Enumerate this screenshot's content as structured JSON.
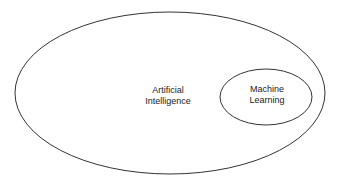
{
  "diagram": {
    "type": "venn-nested",
    "outer": {
      "label_line1": "Artificial",
      "label_line2": "Intelligence"
    },
    "inner": {
      "label_line1": "Machine",
      "label_line2": "Learning"
    },
    "stroke_color": "#333333",
    "background": "#ffffff"
  }
}
